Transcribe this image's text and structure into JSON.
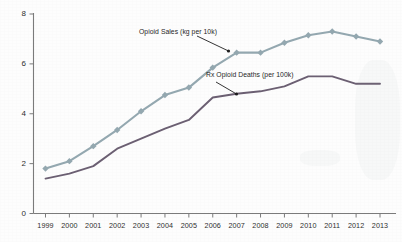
{
  "chart_data": {
    "type": "line",
    "title": "",
    "xlabel": "",
    "ylabel": "",
    "x": [
      1999,
      2000,
      2001,
      2002,
      2003,
      2004,
      2005,
      2006,
      2007,
      2008,
      2009,
      2010,
      2011,
      2012,
      2013
    ],
    "xtick_labels": [
      "1999",
      "2000",
      "2001",
      "2002",
      "2003",
      "2004",
      "2005",
      "2006",
      "2007",
      "2008",
      "2009",
      "2010",
      "2011",
      "2012",
      "2013"
    ],
    "ytick_labels": [
      "0",
      "2",
      "4",
      "6",
      "8"
    ],
    "yticks": [
      0,
      2,
      4,
      6,
      8
    ],
    "ylim": [
      0,
      8
    ],
    "xlim": [
      1999,
      2013
    ],
    "grid": false,
    "legend": "none (inline annotations with arrows)",
    "series": [
      {
        "name": "Opioid Sales (kg per 10k)",
        "color": "#94a8b0",
        "marker": "diamond",
        "values": [
          1.8,
          2.1,
          2.7,
          3.35,
          4.1,
          4.75,
          5.05,
          5.85,
          6.45,
          6.45,
          6.85,
          7.15,
          7.3,
          7.1,
          6.9
        ]
      },
      {
        "name": "Rx Opioid Deaths (per 100k)",
        "color": "#6b5f72",
        "marker": "none",
        "values": [
          1.4,
          1.6,
          1.9,
          2.6,
          3.0,
          3.4,
          3.75,
          4.65,
          4.8,
          4.9,
          5.1,
          5.5,
          5.5,
          5.2,
          5.2
        ]
      }
    ],
    "annotations": [
      {
        "id": "sales-annotation",
        "text": "Opioid Sales (kg per 10k)",
        "points_to_year": 2007,
        "points_to_value": 6.45
      },
      {
        "id": "deaths-annotation",
        "text": "Rx Opioid Deaths (per 100k)",
        "points_to_year": 2007,
        "points_to_value": 4.8
      }
    ]
  },
  "colors": {
    "sales_line": "#94a8b0",
    "deaths_line": "#6b5f72",
    "axis": "#7b7b7b",
    "text": "#2e2e2e",
    "background": "#fdfdfd"
  }
}
